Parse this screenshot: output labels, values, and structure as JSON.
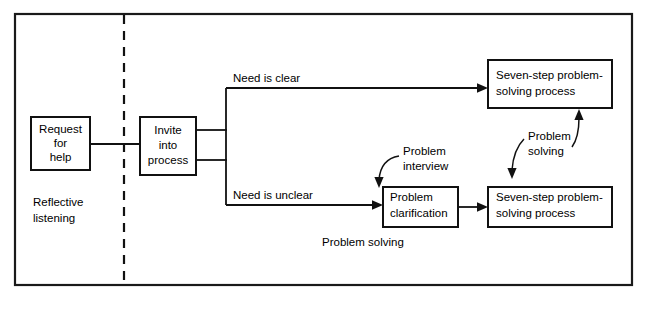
{
  "diagram": {
    "colors": {
      "line": "#111111",
      "background": "#ffffff",
      "text": "#000000"
    },
    "boxes": {
      "request_for_help": {
        "line1": "Request",
        "line2": "for",
        "line3": "help"
      },
      "invite_into_process": {
        "line1": "Invite",
        "line2": "into",
        "line3": "process"
      },
      "problem_clarification": {
        "line1": "Problem",
        "line2": "clarification"
      },
      "seven_step_top": {
        "line1": "Seven-step problem-",
        "line2": "solving process"
      },
      "seven_step_bottom": {
        "line1": "Seven-step problem-",
        "line2": "solving process"
      }
    },
    "edge_labels": {
      "need_is_clear": "Need is clear",
      "need_is_unclear": "Need is unclear"
    },
    "annotations": {
      "problem_interview_line1": "Problem",
      "problem_interview_line2": "interview",
      "problem_solving_line1": "Problem",
      "problem_solving_line2": "solving"
    },
    "zone_labels": {
      "reflective_line1": "Reflective",
      "reflective_line2": "listening",
      "problem_solving_caption": "Problem solving"
    }
  }
}
